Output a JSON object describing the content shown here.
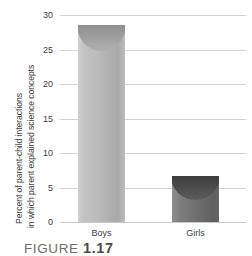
{
  "chart_data": {
    "type": "bar",
    "title": "",
    "subtitle": "",
    "xlabel": "",
    "ylabel": "Percent of parent-child interactions in which parent explained science concepts",
    "ylabel_line1": "Percent of parent-child interactions",
    "ylabel_line2": "in which parent explained science concepts",
    "categories": [
      "Boys",
      "Girls"
    ],
    "values": [
      28.5,
      6.7
    ],
    "series": [
      {
        "name": "Percent explained",
        "values": [
          28.5,
          6.7
        ]
      }
    ],
    "ylim": [
      0,
      30
    ],
    "ytick_step": 5,
    "yticks": [
      "30",
      "25",
      "20",
      "15",
      "10",
      "5",
      "0"
    ],
    "ytick_values": [
      30,
      25,
      20,
      15,
      10,
      5,
      0
    ],
    "grid": true,
    "grid_axis": "y",
    "legend": false,
    "legend_position": "none",
    "bar_colors": [
      "#b4b4b4",
      "#6e6e6e"
    ],
    "grid_color": "#d2d2d2",
    "axis_color": "#c9c9c9",
    "text_color": "#3d3d3d"
  },
  "caption": {
    "prefix": "FIGURE",
    "number": "1.17",
    "full": "FIGURE 1.17"
  }
}
